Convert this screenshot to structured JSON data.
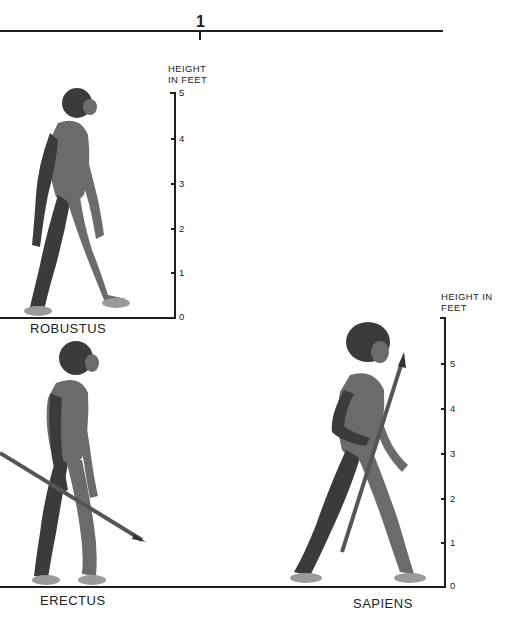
{
  "header": {
    "page_number": "1",
    "timeline_rule": {
      "x_start": 0,
      "x_end": 443,
      "y": 31,
      "marker_x": 200
    }
  },
  "figures": [
    {
      "species": "ROBUSTUS",
      "label_x": 30,
      "label_y": 321,
      "scale_ref": "scale_left"
    },
    {
      "species": "ERECTUS",
      "label_x": 40,
      "label_y": 593,
      "scale_ref": "scale_right",
      "holds": "spear"
    },
    {
      "species": "SAPIENS",
      "label_x": 353,
      "label_y": 596,
      "scale_ref": "scale_right",
      "holds": "spear"
    }
  ],
  "scales": {
    "scale_left": {
      "title_line1": "HEIGHT",
      "title_line2": "IN FEET",
      "unit": "feet",
      "ticks": [
        "0",
        "1",
        "2",
        "3",
        "4",
        "5"
      ],
      "max": 5
    },
    "scale_right": {
      "title_line1": "HEIGHT IN",
      "title_line2": "FEET",
      "unit": "feet",
      "ticks": [
        "0",
        "1",
        "2",
        "3",
        "4",
        "5"
      ],
      "max": 6
    }
  },
  "colors": {
    "background": "#ffffff",
    "ink": "#1e1e1e",
    "figure_shading": "#6b6b6b"
  }
}
